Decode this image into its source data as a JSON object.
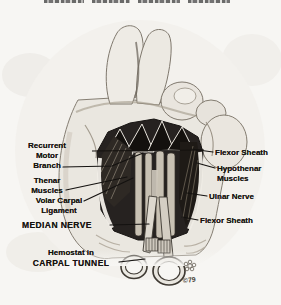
{
  "figure": {
    "signature": "©79"
  },
  "annotations": {
    "left": [
      {
        "id": "recurrent-motor-branch",
        "lines": [
          "Recurrent",
          "Motor",
          "Branch"
        ]
      },
      {
        "id": "thenar-muscles",
        "lines": [
          "Thenar",
          "Muscles"
        ]
      },
      {
        "id": "volar-carpal-ligament",
        "lines": [
          "Volar Carpal",
          "Ligament"
        ]
      },
      {
        "id": "median-nerve",
        "lines": [
          "MEDIAN NERVE"
        ]
      },
      {
        "id": "hemostat-carpal-tunnel",
        "lines": [
          "Hemostat in",
          "CARPAL TUNNEL"
        ]
      }
    ],
    "right": [
      {
        "id": "flexor-sheath-upper",
        "lines": [
          "Flexor Sheath"
        ]
      },
      {
        "id": "hypothenar-muscles",
        "lines": [
          "Hypothenar",
          "Muscles"
        ]
      },
      {
        "id": "ulnar-nerve",
        "lines": [
          "Ulnar Nerve"
        ]
      },
      {
        "id": "flexor-sheath-lower",
        "lines": [
          "Flexor Sheath"
        ]
      }
    ]
  },
  "colors": {
    "paper": "#f7f6f3",
    "ink": "#141210",
    "skin": "#eae7e0",
    "dissection_dark": "#262220"
  }
}
